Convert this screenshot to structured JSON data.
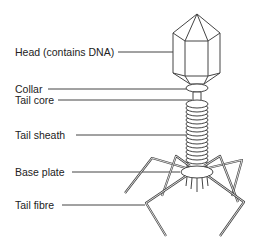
{
  "diagram": {
    "labels": [
      {
        "id": "head",
        "text": "Head (contains DNA)",
        "x": 15,
        "y": 46,
        "line_y": 52,
        "line_x1": 118,
        "line_x2": 180
      },
      {
        "id": "collar",
        "text": "Collar",
        "x": 15,
        "y": 83,
        "line_y": 89,
        "line_x1": 48,
        "line_x2": 188
      },
      {
        "id": "tail-core",
        "text": "Tail core",
        "x": 15,
        "y": 94,
        "line_y": 100,
        "line_x1": 58,
        "line_x2": 192
      },
      {
        "id": "tail-sheath",
        "text": "Tail sheath",
        "x": 15,
        "y": 129,
        "line_y": 135,
        "line_x1": 76,
        "line_x2": 186
      },
      {
        "id": "base-plate",
        "text": "Base plate",
        "x": 15,
        "y": 166,
        "line_y": 172,
        "line_x1": 72,
        "line_x2": 180
      },
      {
        "id": "tail-fibre",
        "text": "Tail fibre",
        "x": 15,
        "y": 199,
        "line_y": 205,
        "line_x1": 62,
        "line_x2": 145
      }
    ],
    "colors": {
      "stroke": "#444444",
      "text": "#222222",
      "background": "#ffffff"
    }
  }
}
